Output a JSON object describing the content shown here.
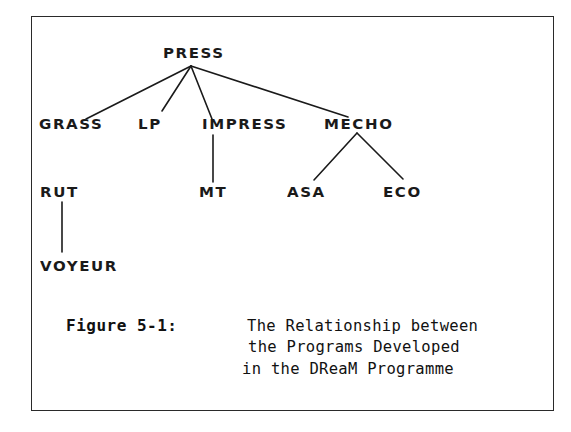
{
  "diagram": {
    "type": "tree",
    "root": "PRESS",
    "nodes": {
      "press": "PRESS",
      "grass": "GRASS",
      "lp": "LP",
      "impress": "IMPRESS",
      "mecho": "MECHO",
      "rut": "RUT",
      "mt": "MT",
      "asa": "ASA",
      "eco": "ECO",
      "voyeur": "VOYEUR"
    },
    "edges": [
      [
        "PRESS",
        "GRASS"
      ],
      [
        "PRESS",
        "LP"
      ],
      [
        "PRESS",
        "IMPRESS"
      ],
      [
        "PRESS",
        "MECHO"
      ],
      [
        "IMPRESS",
        "MT"
      ],
      [
        "MECHO",
        "ASA"
      ],
      [
        "MECHO",
        "ECO"
      ],
      [
        "RUT",
        "VOYEUR"
      ]
    ]
  },
  "caption": {
    "label": "Figure 5-1:",
    "lines": [
      "The Relationship between",
      "the Programs Developed",
      "in the DReaM Programme"
    ]
  },
  "colors": {
    "ink": "#1a1a1a",
    "background": "#ffffff"
  }
}
